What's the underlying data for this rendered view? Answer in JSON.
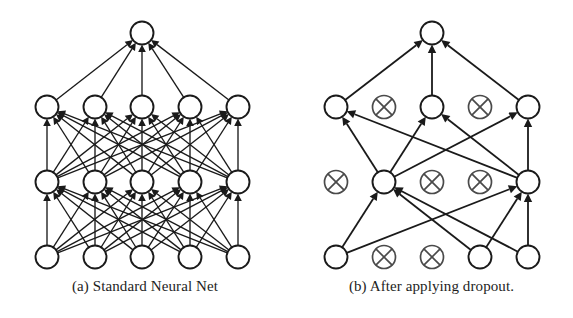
{
  "figure": {
    "background_color": "#ffffff",
    "ink_color": "#1a1a1a",
    "dropped_color": "#4a4a4a",
    "width": 573,
    "height": 318
  },
  "panels": [
    {
      "id": "a",
      "caption": "(a) Standard Neural Net",
      "origin_x": 0,
      "width": 290,
      "node_radius": 11.5,
      "layers": [
        {
          "name": "output",
          "y": 33,
          "nodes": [
            {
              "x": 142,
              "dropped": false
            }
          ]
        },
        {
          "name": "hidden-2",
          "y": 107,
          "nodes": [
            {
              "x": 47,
              "dropped": false
            },
            {
              "x": 95,
              "dropped": false
            },
            {
              "x": 142,
              "dropped": false
            },
            {
              "x": 190,
              "dropped": false
            },
            {
              "x": 238,
              "dropped": false
            }
          ]
        },
        {
          "name": "hidden-1",
          "y": 182,
          "nodes": [
            {
              "x": 47,
              "dropped": false
            },
            {
              "x": 95,
              "dropped": false
            },
            {
              "x": 142,
              "dropped": false
            },
            {
              "x": 190,
              "dropped": false
            },
            {
              "x": 238,
              "dropped": false
            }
          ]
        },
        {
          "name": "input",
          "y": 257,
          "nodes": [
            {
              "x": 47,
              "dropped": false
            },
            {
              "x": 95,
              "dropped": false
            },
            {
              "x": 142,
              "dropped": false
            },
            {
              "x": 190,
              "dropped": false
            },
            {
              "x": 238,
              "dropped": false
            }
          ]
        }
      ],
      "connections": "fully-connected",
      "edges": [
        [
          3,
          0,
          2,
          0
        ],
        [
          3,
          0,
          2,
          1
        ],
        [
          3,
          0,
          2,
          2
        ],
        [
          3,
          0,
          2,
          3
        ],
        [
          3,
          0,
          2,
          4
        ],
        [
          3,
          1,
          2,
          0
        ],
        [
          3,
          1,
          2,
          1
        ],
        [
          3,
          1,
          2,
          2
        ],
        [
          3,
          1,
          2,
          3
        ],
        [
          3,
          1,
          2,
          4
        ],
        [
          3,
          2,
          2,
          0
        ],
        [
          3,
          2,
          2,
          1
        ],
        [
          3,
          2,
          2,
          2
        ],
        [
          3,
          2,
          2,
          3
        ],
        [
          3,
          2,
          2,
          4
        ],
        [
          3,
          3,
          2,
          0
        ],
        [
          3,
          3,
          2,
          1
        ],
        [
          3,
          3,
          2,
          2
        ],
        [
          3,
          3,
          2,
          3
        ],
        [
          3,
          3,
          2,
          4
        ],
        [
          3,
          4,
          2,
          0
        ],
        [
          3,
          4,
          2,
          1
        ],
        [
          3,
          4,
          2,
          2
        ],
        [
          3,
          4,
          2,
          3
        ],
        [
          3,
          4,
          2,
          4
        ],
        [
          2,
          0,
          1,
          0
        ],
        [
          2,
          0,
          1,
          1
        ],
        [
          2,
          0,
          1,
          2
        ],
        [
          2,
          0,
          1,
          3
        ],
        [
          2,
          0,
          1,
          4
        ],
        [
          2,
          1,
          1,
          0
        ],
        [
          2,
          1,
          1,
          1
        ],
        [
          2,
          1,
          1,
          2
        ],
        [
          2,
          1,
          1,
          3
        ],
        [
          2,
          1,
          1,
          4
        ],
        [
          2,
          2,
          1,
          0
        ],
        [
          2,
          2,
          1,
          1
        ],
        [
          2,
          2,
          1,
          2
        ],
        [
          2,
          2,
          1,
          3
        ],
        [
          2,
          2,
          1,
          4
        ],
        [
          2,
          3,
          1,
          0
        ],
        [
          2,
          3,
          1,
          1
        ],
        [
          2,
          3,
          1,
          2
        ],
        [
          2,
          3,
          1,
          3
        ],
        [
          2,
          3,
          1,
          4
        ],
        [
          2,
          4,
          1,
          0
        ],
        [
          2,
          4,
          1,
          1
        ],
        [
          2,
          4,
          1,
          2
        ],
        [
          2,
          4,
          1,
          3
        ],
        [
          2,
          4,
          1,
          4
        ],
        [
          1,
          0,
          0,
          0
        ],
        [
          1,
          1,
          0,
          0
        ],
        [
          1,
          2,
          0,
          0
        ],
        [
          1,
          3,
          0,
          0
        ],
        [
          1,
          4,
          0,
          0
        ]
      ]
    },
    {
      "id": "b",
      "caption": "(b) After applying dropout.",
      "origin_x": 290,
      "width": 283,
      "node_radius": 11.5,
      "layers": [
        {
          "name": "output",
          "y": 33,
          "nodes": [
            {
              "x": 142,
              "dropped": false
            }
          ]
        },
        {
          "name": "hidden-2",
          "y": 107,
          "nodes": [
            {
              "x": 46,
              "dropped": false
            },
            {
              "x": 94,
              "dropped": true
            },
            {
              "x": 142,
              "dropped": false
            },
            {
              "x": 190,
              "dropped": true
            },
            {
              "x": 238,
              "dropped": false
            }
          ]
        },
        {
          "name": "hidden-1",
          "y": 182,
          "nodes": [
            {
              "x": 46,
              "dropped": true
            },
            {
              "x": 94,
              "dropped": false
            },
            {
              "x": 142,
              "dropped": true
            },
            {
              "x": 190,
              "dropped": true
            },
            {
              "x": 238,
              "dropped": false
            }
          ]
        },
        {
          "name": "input",
          "y": 257,
          "nodes": [
            {
              "x": 46,
              "dropped": false
            },
            {
              "x": 94,
              "dropped": true
            },
            {
              "x": 142,
              "dropped": true
            },
            {
              "x": 190,
              "dropped": false
            },
            {
              "x": 238,
              "dropped": false
            }
          ]
        }
      ],
      "connections": "thinned",
      "edges": [
        [
          3,
          0,
          2,
          1
        ],
        [
          3,
          0,
          2,
          4
        ],
        [
          3,
          3,
          2,
          1
        ],
        [
          3,
          3,
          2,
          4
        ],
        [
          3,
          4,
          2,
          1
        ],
        [
          3,
          4,
          2,
          4
        ],
        [
          2,
          1,
          1,
          0
        ],
        [
          2,
          1,
          1,
          2
        ],
        [
          2,
          1,
          1,
          4
        ],
        [
          2,
          4,
          1,
          0
        ],
        [
          2,
          4,
          1,
          2
        ],
        [
          2,
          4,
          1,
          4
        ],
        [
          1,
          0,
          0,
          0
        ],
        [
          1,
          2,
          0,
          0
        ],
        [
          1,
          4,
          0,
          0
        ]
      ]
    }
  ]
}
